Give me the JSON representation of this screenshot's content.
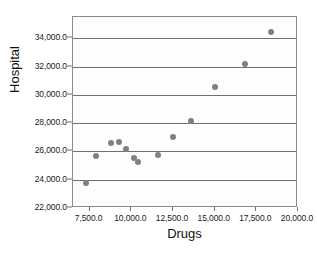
{
  "chart_data": {
    "type": "scatter",
    "title": "",
    "xlabel": "Drugs",
    "ylabel": "Hospital",
    "xlim": [
      6500,
      20000
    ],
    "ylim": [
      22000,
      35500
    ],
    "grid": true,
    "legend": "none",
    "marker_color": "#808080",
    "xticks": [
      7500,
      10000,
      12500,
      15000,
      17500,
      20000
    ],
    "xtick_labels": [
      "7,500.0",
      "10,000.0",
      "12,500.0",
      "15,000.0",
      "17,500.0",
      "20,000.0"
    ],
    "yticks": [
      22000,
      24000,
      26000,
      28000,
      30000,
      32000,
      34000
    ],
    "ytick_labels": [
      "22,000.0",
      "24,000.0",
      "26,000.0",
      "28,000.0",
      "30,000.0",
      "32,000.0",
      "34,000.0"
    ],
    "gridlines_y": [
      24000,
      26000,
      28000,
      30000,
      32000,
      34000
    ],
    "points": [
      {
        "x": 7300,
        "y": 23800
      },
      {
        "x": 7850,
        "y": 25700
      },
      {
        "x": 8800,
        "y": 26600
      },
      {
        "x": 9250,
        "y": 26700
      },
      {
        "x": 9650,
        "y": 26150
      },
      {
        "x": 10150,
        "y": 25500
      },
      {
        "x": 10400,
        "y": 25250
      },
      {
        "x": 11600,
        "y": 25750
      },
      {
        "x": 12500,
        "y": 27050
      },
      {
        "x": 13550,
        "y": 28150
      },
      {
        "x": 15000,
        "y": 30550
      },
      {
        "x": 16800,
        "y": 32200
      },
      {
        "x": 18400,
        "y": 34450
      }
    ]
  }
}
